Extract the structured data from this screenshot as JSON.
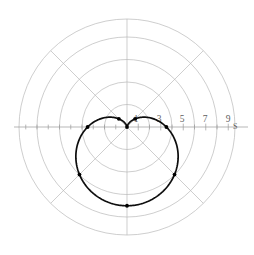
{
  "chart_data": {
    "type": "line",
    "subtype": "polar",
    "title": "",
    "xlabel": "",
    "ylabel": "",
    "axis_name": "S",
    "curve_equation": "r = 3.5 (1 - sin(theta))",
    "curve_name": "cardioid",
    "radial_max": 9.6,
    "radial_tick_labels": [
      "1",
      "3",
      "5",
      "7",
      "9"
    ],
    "radial_tick_values": [
      1,
      3,
      5,
      7,
      9
    ],
    "radial_minor_tick_values": [
      2,
      4,
      6,
      8
    ],
    "grid": true,
    "grid_circle_radii": [
      2,
      4,
      6,
      8,
      9.6
    ],
    "grid_spoke_count": 8,
    "grid_spoke_angles_deg": [
      0,
      45,
      90,
      135,
      180,
      225,
      270,
      315
    ],
    "legend": "none",
    "theta_unit": "radians",
    "points_theta_deg": [
      90,
      135,
      180,
      225,
      270,
      315,
      0,
      45
    ],
    "points_r": [
      7.0,
      5.975,
      3.5,
      1.025,
      0.0,
      1.025,
      3.5,
      5.975
    ],
    "series": [
      {
        "name": "r = 3.5(1 - sin t)",
        "theta_deg": [
          90,
          135,
          180,
          225,
          270,
          315,
          0,
          45
        ],
        "r": [
          7.0,
          5.975,
          3.5,
          1.025,
          0.0,
          1.025,
          3.5,
          5.975
        ]
      }
    ]
  },
  "plot": {
    "center_x": 127,
    "center_y": 127,
    "pixels_per_unit": 11.25,
    "colors": {
      "curve": "#0d0d0d",
      "grid": "#b9b9b9",
      "axis": "#9a9a9a",
      "label": "#5e5e5e",
      "background": "#ffffff",
      "marker": "#000000"
    }
  },
  "labels": {
    "t1": "1",
    "t3": "3",
    "t5": "5",
    "t7": "7",
    "t9": "9",
    "axis_s": "S"
  }
}
